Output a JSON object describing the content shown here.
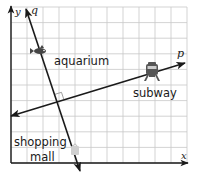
{
  "diagram": {
    "type": "coordinate-grid-map",
    "grid": {
      "left": 11,
      "top": 7,
      "right": 187,
      "bottom": 163,
      "cell_w": 16,
      "cell_h": 15.6,
      "line_color": "#c8c8c8",
      "axis_color": "#1a1a1a"
    },
    "axes": {
      "x_label": "x",
      "y_label": "y"
    },
    "lines": [
      {
        "name": "q",
        "label": "q",
        "x1": 80,
        "y1": 171,
        "x2": 26,
        "y2": 9
      },
      {
        "name": "p",
        "label": "p",
        "x1": 11,
        "y1": 116,
        "x2": 185,
        "y2": 63
      }
    ],
    "intersection": {
      "x": 57,
      "y": 101,
      "right_angle": true
    },
    "landmarks": [
      {
        "name": "aquarium",
        "label": "aquarium",
        "icon": "fish-icon",
        "icon_x": 39,
        "icon_y": 51,
        "label_x": 54,
        "label_y": 64
      },
      {
        "name": "subway",
        "label": "subway",
        "icon": "train-icon",
        "icon_x": 152,
        "icon_y": 72,
        "label_x": 152,
        "label_y": 96
      },
      {
        "name": "shopping-mall",
        "label_line1": "shopping",
        "label_line2": "mall",
        "icon": "shopping-bag-icon",
        "icon_x": 75,
        "icon_y": 148,
        "label_x": 35,
        "label_y1": 146,
        "label_y2": 162
      }
    ]
  }
}
